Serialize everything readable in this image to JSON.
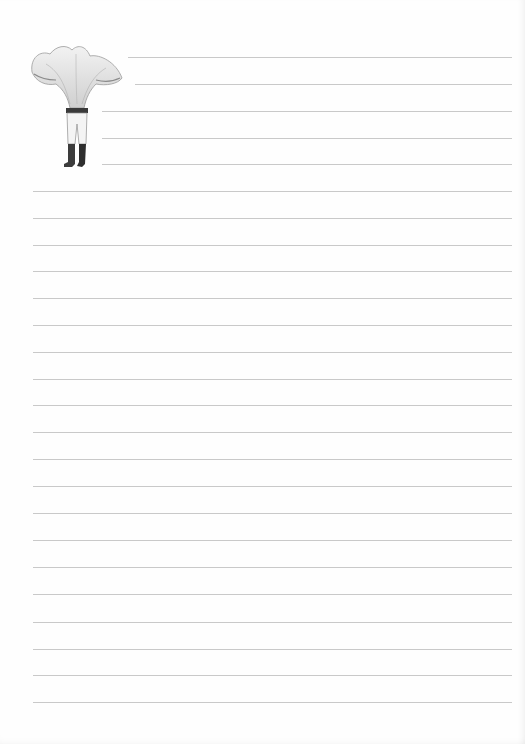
{
  "page": {
    "type": "lined writing paper",
    "background": "#fefefe",
    "rule_color": "#c9c9c9",
    "rule_right": 512,
    "rules": [
      {
        "y": 57,
        "x": 128
      },
      {
        "y": 84,
        "x": 135
      },
      {
        "y": 111,
        "x": 102
      },
      {
        "y": 138,
        "x": 102
      },
      {
        "y": 164,
        "x": 102
      },
      {
        "y": 191,
        "x": 33
      },
      {
        "y": 218,
        "x": 33
      },
      {
        "y": 245,
        "x": 33
      },
      {
        "y": 271,
        "x": 33
      },
      {
        "y": 298,
        "x": 33
      },
      {
        "y": 325,
        "x": 33
      },
      {
        "y": 352,
        "x": 33
      },
      {
        "y": 379,
        "x": 33
      },
      {
        "y": 405,
        "x": 33
      },
      {
        "y": 432,
        "x": 33
      },
      {
        "y": 459,
        "x": 33
      },
      {
        "y": 486,
        "x": 33
      },
      {
        "y": 513,
        "x": 33
      },
      {
        "y": 540,
        "x": 33
      },
      {
        "y": 567,
        "x": 33
      },
      {
        "y": 594,
        "x": 33
      },
      {
        "y": 622,
        "x": 33
      },
      {
        "y": 649,
        "x": 33
      },
      {
        "y": 675,
        "x": 33
      },
      {
        "y": 702,
        "x": 33
      }
    ]
  },
  "illustration": {
    "icon": "mushroom-headed-figure",
    "description": "pencil sketch of a chanterelle mushroom cap atop legs in trousers and dark boots"
  }
}
